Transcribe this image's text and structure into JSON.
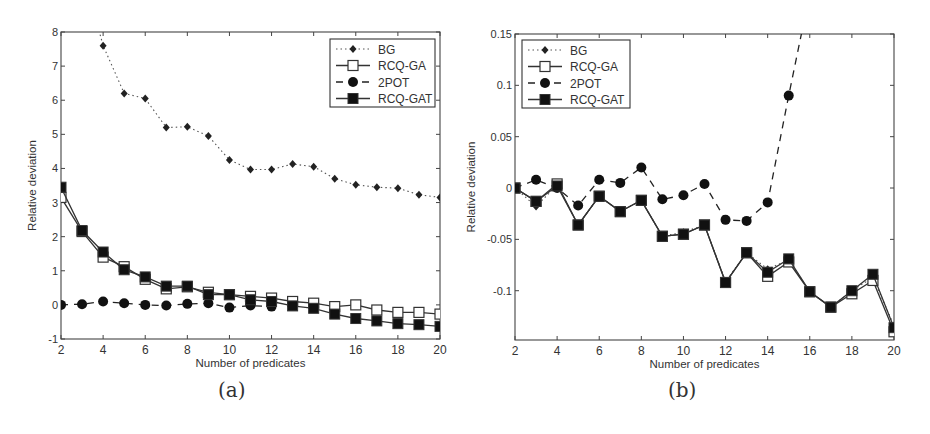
{
  "figure": {
    "panels": [
      {
        "caption": "(a)"
      },
      {
        "caption": "(b)"
      }
    ]
  },
  "chart_data": [
    {
      "type": "line",
      "panel": "(a)",
      "title": "",
      "xlabel": "Number of predicates",
      "ylabel": "Relative deviation",
      "xlim": [
        2,
        20
      ],
      "ylim": [
        -1,
        8
      ],
      "xticks": [
        2,
        4,
        6,
        8,
        10,
        12,
        14,
        16,
        18,
        20
      ],
      "yticks": [
        -1,
        0,
        1,
        2,
        3,
        4,
        5,
        6,
        7,
        8
      ],
      "grid": false,
      "legend_position": "upper right",
      "x": [
        2,
        3,
        4,
        5,
        6,
        7,
        8,
        9,
        10,
        11,
        12,
        13,
        14,
        15,
        16,
        17,
        18,
        19,
        20
      ],
      "series": [
        {
          "name": "BG",
          "style": "dotted",
          "marker": "diamond",
          "values": [
            null,
            null,
            7.6,
            6.2,
            6.05,
            5.2,
            5.22,
            4.95,
            4.25,
            3.97,
            3.97,
            4.13,
            4.05,
            3.7,
            3.52,
            3.45,
            3.42,
            3.23,
            3.15
          ]
        },
        {
          "name": "RCQ-GA",
          "style": "solid",
          "marker": "open-square",
          "values": [
            3.15,
            2.15,
            1.4,
            1.12,
            0.75,
            0.47,
            0.53,
            0.37,
            0.3,
            0.25,
            0.2,
            0.1,
            0.05,
            -0.05,
            0.0,
            -0.15,
            -0.22,
            -0.22,
            -0.27
          ]
        },
        {
          "name": "2POT",
          "style": "dashed",
          "marker": "filled-circle",
          "values": [
            0.0,
            0.02,
            0.1,
            0.05,
            0.0,
            -0.02,
            0.03,
            0.05,
            -0.08,
            -0.02,
            -0.05,
            null,
            null,
            null,
            null,
            null,
            null,
            null,
            null
          ]
        },
        {
          "name": "RCQ-GAT",
          "style": "solid",
          "marker": "filled-square",
          "values": [
            3.45,
            2.18,
            1.55,
            1.03,
            0.82,
            0.55,
            0.55,
            0.3,
            0.3,
            0.15,
            0.1,
            -0.03,
            -0.1,
            -0.27,
            -0.4,
            -0.47,
            -0.55,
            -0.58,
            -0.63
          ]
        }
      ]
    },
    {
      "type": "line",
      "panel": "(b)",
      "title": "",
      "xlabel": "Number of predicates",
      "ylabel": "Relative deviation",
      "xlim": [
        2,
        20
      ],
      "ylim": [
        -0.148,
        0.15
      ],
      "xticks": [
        2,
        4,
        6,
        8,
        10,
        12,
        14,
        16,
        18,
        20
      ],
      "yticks": [
        -0.1,
        -0.05,
        0,
        0.05,
        0.1,
        0.15
      ],
      "ytick_labels": [
        "-0.1",
        "-0.05",
        "0",
        "0.05",
        "0.1",
        "0.15"
      ],
      "grid": false,
      "legend_position": "upper left",
      "x": [
        2,
        3,
        4,
        5,
        6,
        7,
        8,
        9,
        10,
        11,
        12,
        13,
        14,
        15,
        16,
        17,
        18,
        19,
        20
      ],
      "series": [
        {
          "name": "BG",
          "style": "dotted",
          "marker": "diamond",
          "values": [
            0.0,
            -0.018,
            0.003,
            -0.036,
            -0.008,
            -0.023,
            -0.012,
            -0.047,
            -0.043,
            -0.036,
            -0.091,
            -0.063,
            -0.079,
            -0.07,
            -0.101,
            -0.116,
            -0.1,
            -0.087,
            -0.134
          ]
        },
        {
          "name": "RCQ-GA",
          "style": "solid",
          "marker": "open-square",
          "values": [
            0.0,
            -0.013,
            0.004,
            -0.036,
            -0.008,
            -0.023,
            -0.012,
            -0.047,
            -0.045,
            -0.036,
            -0.092,
            -0.063,
            -0.086,
            -0.072,
            -0.101,
            -0.116,
            -0.103,
            -0.09,
            -0.14
          ]
        },
        {
          "name": "2POT",
          "style": "dashed",
          "marker": "filled-circle",
          "values": [
            0.0,
            0.008,
            0.0,
            -0.017,
            0.008,
            0.005,
            0.02,
            -0.011,
            -0.007,
            0.004,
            -0.031,
            -0.032,
            -0.014,
            0.09,
            null,
            null,
            null,
            null,
            null
          ],
          "note": "line continues above 0.15 after x=15"
        },
        {
          "name": "RCQ-GAT",
          "style": "solid",
          "marker": "filled-square",
          "values": [
            0.0,
            -0.013,
            0.002,
            -0.036,
            -0.008,
            -0.023,
            -0.012,
            -0.047,
            -0.045,
            -0.036,
            -0.092,
            -0.063,
            -0.082,
            -0.069,
            -0.101,
            -0.116,
            -0.1,
            -0.084,
            -0.136
          ]
        }
      ]
    }
  ]
}
